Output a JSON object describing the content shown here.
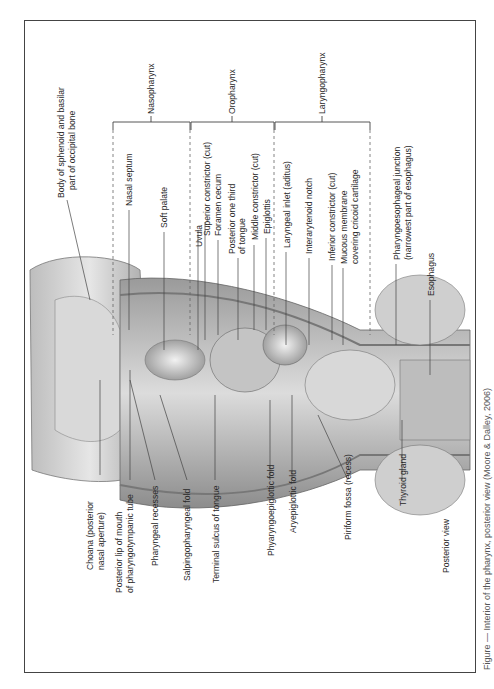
{
  "figure": {
    "view_label": "Posterior view",
    "regions": [
      {
        "name": "Nasopharynx"
      },
      {
        "name": "Oropharynx"
      },
      {
        "name": "Laryngopharynx"
      }
    ],
    "labels_right": [
      "Body of sphenoid and basilar",
      "part of occipital bone",
      "Nasal septum",
      "Soft palate",
      "Uvula",
      "Superior constrictor (cut)",
      "Foramen cecum",
      "Posterior one third",
      "of tongue",
      "Middle constrictor (cut)",
      "Epiglottis",
      "Laryngeal inlet (aditus)",
      "Interarytenoid notch",
      "Inferior constrictor (cut)",
      "Mucous membrane",
      "covering cricoid cartilage",
      "Pharyngoesophageal junction",
      "(narrowest part of esophagus)",
      "Esophagus"
    ],
    "labels_left": [
      "Choana (posterior",
      "nasal aperture)",
      "Posterior lip of mouth",
      "of pharyngotympanic tube",
      "Pharyngeal recesses",
      "Salpingopharyngeal fold",
      "Terminal sulcus of tongue",
      "Phyaryngoepiglottic fold",
      "Aryepiglottic fold",
      "Piriform fossa (recess)",
      "Thyroid gland"
    ]
  },
  "caption": {
    "text": "Figure — Interior of the pharynx, posterior view (Moore & Dalley, 2006)"
  }
}
